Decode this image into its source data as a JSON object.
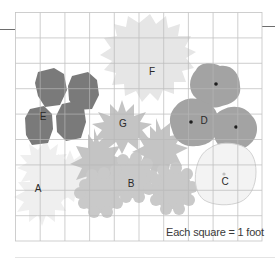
{
  "diagram": {
    "type": "garden-planting-plan",
    "grid": {
      "columns": 10,
      "rows": 9,
      "unit": "1 foot"
    },
    "scale_note": "Each square = 1 foot",
    "colors": {
      "grid_line": "#b9b9b9",
      "plant_E": "#7a7a7a",
      "plant_D": "#a3a3a3",
      "plant_G": "#c4c4c4",
      "plant_B": "#c9c9c9",
      "plant_F": "#e6e6e6",
      "plant_A": "#efefef",
      "plant_C_fill": "#f3f3f3",
      "plant_C_outline": "#d2d2d2"
    },
    "plants": [
      {
        "id": "A",
        "label": "A",
        "count": 2
      },
      {
        "id": "B",
        "label": "B",
        "count": 3
      },
      {
        "id": "C",
        "label": "C",
        "count": 1
      },
      {
        "id": "D",
        "label": "D",
        "count": 3
      },
      {
        "id": "E",
        "label": "E",
        "count": 4
      },
      {
        "id": "F",
        "label": "F",
        "count": 1
      },
      {
        "id": "G",
        "label": "G",
        "count": 3
      }
    ]
  }
}
